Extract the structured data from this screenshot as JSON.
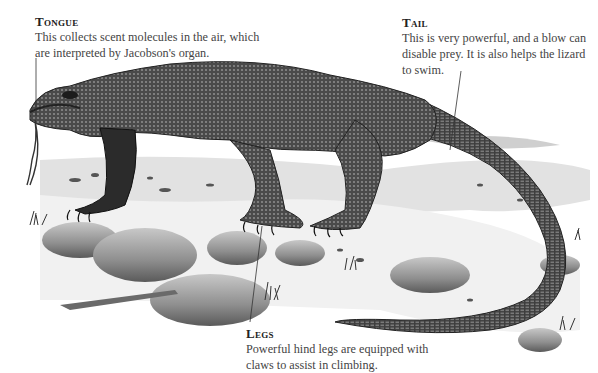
{
  "illustration": {
    "subject": "Komodo dragon",
    "style": "monochrome illustration"
  },
  "callouts": {
    "tongue": {
      "title": "Tongue",
      "body": "This collects scent molecules in the air, which are interpreted by Jacobson's organ."
    },
    "tail": {
      "title": "Tail",
      "body": "This is very powerful, and a blow can disable prey. It is also helps the lizard to swim."
    },
    "legs": {
      "title": "Legs",
      "body": "Powerful hind legs are equipped with claws to assist in climbing."
    }
  },
  "colors": {
    "background": "#ffffff",
    "text": "#444444",
    "leader_line": "#333333",
    "body_dark": "#3b3b3b",
    "body_mid": "#6a6a6a",
    "rock": "#9a9a9a",
    "ground": "#d8d8d8"
  }
}
